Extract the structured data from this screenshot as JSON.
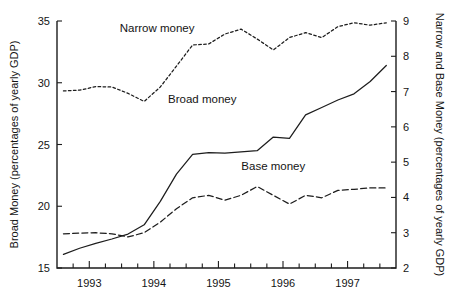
{
  "chart_data": {
    "type": "line",
    "title": "",
    "xlabel": "",
    "ylabel": "Broad Money (percentages of yearly GDP)",
    "y2label": "Narrow and Base Money (percentages of yearly GDP)",
    "grid": false,
    "legend_position": "inline-annotations",
    "xlim": [
      1992.5,
      1997.75
    ],
    "ylim": [
      15,
      35
    ],
    "y2lim": [
      2,
      9
    ],
    "x_tick_labels": [
      "1993",
      "1994",
      "1995",
      "1996",
      "1997"
    ],
    "x_tick_values": [
      1993,
      1994,
      1995,
      1996,
      1997
    ],
    "x_minor_tick_values": [
      1992.75,
      1993.25,
      1993.5,
      1993.75,
      1994.25,
      1994.5,
      1994.75,
      1995.25,
      1995.5,
      1995.75,
      1996.25,
      1996.5,
      1996.75,
      1997.25,
      1997.5
    ],
    "y_tick_labels": [
      "15",
      "20",
      "25",
      "30",
      "35"
    ],
    "y_tick_values": [
      15,
      20,
      25,
      30,
      35
    ],
    "y2_tick_labels": [
      "2",
      "3",
      "4",
      "5",
      "6",
      "7",
      "8",
      "9"
    ],
    "y2_tick_values": [
      2,
      3,
      4,
      5,
      6,
      7,
      8,
      9
    ],
    "series": [
      {
        "name": "Broad money",
        "axis": "left",
        "linestyle": "solid",
        "annotation": "Broad money",
        "x": [
          1992.6,
          1992.85,
          1993.1,
          1993.35,
          1993.6,
          1993.85,
          1994.1,
          1994.35,
          1994.6,
          1994.85,
          1995.1,
          1995.35,
          1995.6,
          1995.85,
          1996.1,
          1996.35,
          1996.6,
          1996.85,
          1997.1,
          1997.35,
          1997.6
        ],
        "y": [
          16.1,
          16.6,
          17.0,
          17.35,
          17.75,
          18.5,
          20.4,
          22.6,
          24.2,
          24.35,
          24.3,
          24.4,
          24.5,
          25.6,
          25.5,
          27.4,
          28.0,
          28.6,
          29.1,
          30.1,
          31.4
        ]
      },
      {
        "name": "Narrow money",
        "axis": "right",
        "linestyle": "dotted",
        "annotation": "Narrow money",
        "x": [
          1992.6,
          1992.85,
          1993.1,
          1993.35,
          1993.6,
          1993.85,
          1994.1,
          1994.35,
          1994.6,
          1994.85,
          1995.1,
          1995.35,
          1995.6,
          1995.85,
          1996.1,
          1996.35,
          1996.6,
          1996.85,
          1997.1,
          1997.35,
          1997.6
        ],
        "y_left_scale": [
          27.2,
          27.25,
          27.55,
          27.5,
          27.0,
          26.35,
          27.5,
          29.2,
          30.9,
          31.0,
          31.8,
          32.2,
          31.4,
          30.5,
          31.5,
          31.9,
          31.5,
          32.4,
          32.7,
          32.5,
          32.7
        ],
        "y": [
          7.02,
          7.04,
          7.14,
          7.13,
          6.95,
          6.72,
          7.13,
          7.72,
          8.32,
          8.35,
          8.63,
          8.77,
          8.49,
          8.18,
          8.53,
          8.67,
          8.53,
          8.84,
          8.95,
          8.88,
          8.95
        ]
      },
      {
        "name": "Base money",
        "axis": "right",
        "linestyle": "dashed",
        "annotation": "Base money",
        "x": [
          1992.6,
          1992.85,
          1993.1,
          1993.35,
          1993.6,
          1993.85,
          1994.1,
          1994.35,
          1994.6,
          1994.85,
          1995.1,
          1995.35,
          1995.6,
          1995.85,
          1996.1,
          1996.35,
          1996.6,
          1996.85,
          1997.1,
          1997.35,
          1997.6
        ],
        "y_left_scale": [
          18.0,
          18.05,
          18.1,
          18.0,
          17.75,
          18.1,
          19.0,
          20.1,
          21.0,
          21.2,
          20.8,
          21.2,
          21.9,
          21.2,
          20.5,
          21.2,
          21.0,
          21.6,
          21.7,
          21.8,
          21.8
        ],
        "y": [
          2.97,
          2.99,
          3.0,
          2.97,
          2.88,
          3.0,
          3.3,
          3.68,
          3.99,
          4.06,
          3.92,
          4.06,
          4.31,
          4.06,
          3.81,
          4.06,
          3.99,
          4.2,
          4.23,
          4.27,
          4.27
        ]
      }
    ],
    "annotations": [
      {
        "text": "Narrow money",
        "x": 1994.05,
        "y_left": 34.1
      },
      {
        "text": "Broad money",
        "x": 1994.75,
        "y_left": 28.4
      },
      {
        "text": "Base money",
        "x": 1995.85,
        "y_left": 22.9
      }
    ]
  }
}
